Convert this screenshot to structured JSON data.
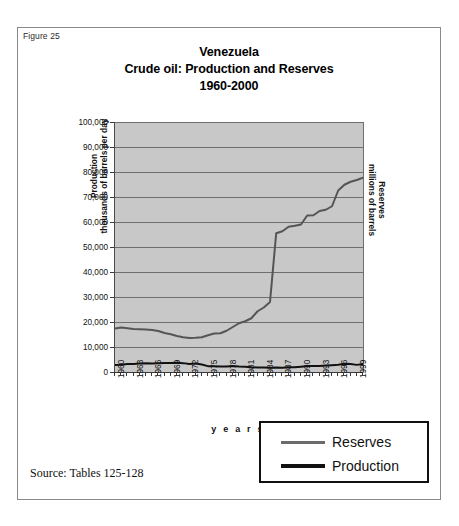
{
  "figure": {
    "label": "Figure 25",
    "source_note": "Source: Tables 125-128"
  },
  "chart_data": {
    "type": "line",
    "title": "Venezuela\nCrude oil: Production and Reserves\n1960-2000",
    "title_lines": [
      "Venezuela",
      "Crude oil: Production and Reserves",
      "1960-2000"
    ],
    "xlabel": "y e a r s",
    "ylabel": "Production\nthousands of barrels per day",
    "ylabel_lines": [
      "Production",
      "thousands of barrels per day"
    ],
    "y2label": "Reserves\nmillions of barrels",
    "y2label_lines": [
      "Reserves",
      "millions of barrels"
    ],
    "ylim": [
      0,
      100000
    ],
    "yticks": [
      100000,
      90000,
      80000,
      70000,
      60000,
      50000,
      40000,
      30000,
      20000,
      10000,
      0
    ],
    "ytick_labels": [
      "100,000",
      "90,000",
      "80,000",
      "70,000",
      "60,000",
      "50,000",
      "40,000",
      "30,000",
      "20,000",
      "10,000",
      "0"
    ],
    "xlim": [
      1960,
      2000
    ],
    "xtick_labels": [
      "1960",
      "1963",
      "1966",
      "1969",
      "1972",
      "1975",
      "1978",
      "1981",
      "1984",
      "1987",
      "1990",
      "1993",
      "1996",
      "1999"
    ],
    "grid": true,
    "plot_background": "#c8c8c8",
    "legend_position": "below-right",
    "x": [
      1960,
      1961,
      1962,
      1963,
      1964,
      1965,
      1966,
      1967,
      1968,
      1969,
      1970,
      1971,
      1972,
      1973,
      1974,
      1975,
      1976,
      1977,
      1978,
      1979,
      1980,
      1981,
      1982,
      1983,
      1984,
      1985,
      1986,
      1987,
      1988,
      1989,
      1990,
      1991,
      1992,
      1993,
      1994,
      1995,
      1996,
      1997,
      1998,
      1999,
      2000
    ],
    "series": [
      {
        "name": "Reserves",
        "units": "millions of barrels",
        "color": "#555555",
        "line_width": 2,
        "values": [
          17400,
          17800,
          17500,
          17200,
          17100,
          17000,
          16800,
          16400,
          15600,
          15100,
          14400,
          13900,
          13600,
          13700,
          13900,
          14700,
          15400,
          15500,
          16500,
          18000,
          19500,
          20300,
          21500,
          24300,
          25800,
          28000,
          55500,
          56300,
          58100,
          58500,
          59000,
          62600,
          62700,
          64400,
          64900,
          66300,
          72600,
          74900,
          76100,
          76800,
          77700
        ]
      },
      {
        "name": "Production",
        "units": "thousands of barrels per day",
        "color": "#111111",
        "line_width": 2,
        "values": [
          2850,
          2920,
          3200,
          3250,
          3390,
          3470,
          3370,
          3540,
          3600,
          3590,
          3710,
          3550,
          3220,
          3370,
          2980,
          2350,
          2290,
          2240,
          2160,
          2360,
          2170,
          2110,
          1890,
          1800,
          1800,
          1680,
          1790,
          1750,
          1900,
          1910,
          2140,
          2380,
          2370,
          2450,
          2590,
          2750,
          2940,
          3280,
          3170,
          2850,
          3155
        ]
      }
    ]
  },
  "legend": {
    "items": [
      {
        "label": "Reserves",
        "color": "#6b6b6b"
      },
      {
        "label": "Production",
        "color": "#111111"
      }
    ]
  }
}
